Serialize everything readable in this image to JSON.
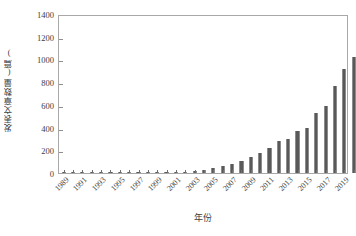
{
  "chart_data": {
    "type": "bar",
    "title": "",
    "xlabel": "年份",
    "ylabel": "发表文章数量(篇)",
    "ylim": [
      0,
      1400
    ],
    "ytick_labels": [
      "1400",
      "1200",
      "1000",
      "800",
      "600",
      "400",
      "200",
      "0"
    ],
    "ytick_values": [
      1400,
      1200,
      1000,
      800,
      600,
      400,
      200,
      0
    ],
    "xtick_labels": [
      "1989",
      "1991",
      "1993",
      "1995",
      "1997",
      "1999",
      "2001",
      "2003",
      "2005",
      "2007",
      "2009",
      "2011",
      "2013",
      "2015",
      "2017",
      "2019"
    ],
    "grid": false,
    "legend": null,
    "bar_color": "#595959",
    "categories": [
      "1989",
      "1990",
      "1991",
      "1992",
      "1993",
      "1994",
      "1995",
      "1996",
      "1997",
      "1998",
      "1999",
      "2000",
      "2001",
      "2002",
      "2003",
      "2004",
      "2005",
      "2006",
      "2007",
      "2008",
      "2009",
      "2010",
      "2011",
      "2012",
      "2013",
      "2014",
      "2015",
      "2016",
      "2017",
      "2018",
      "2019"
    ],
    "values": [
      1,
      2,
      3,
      3,
      2,
      4,
      6,
      5,
      7,
      6,
      8,
      7,
      12,
      9,
      18,
      26,
      48,
      62,
      76,
      108,
      140,
      172,
      220,
      280,
      298,
      368,
      400,
      528,
      588,
      766,
      912
    ],
    "values_extended": [
      1022,
      1312
    ]
  }
}
